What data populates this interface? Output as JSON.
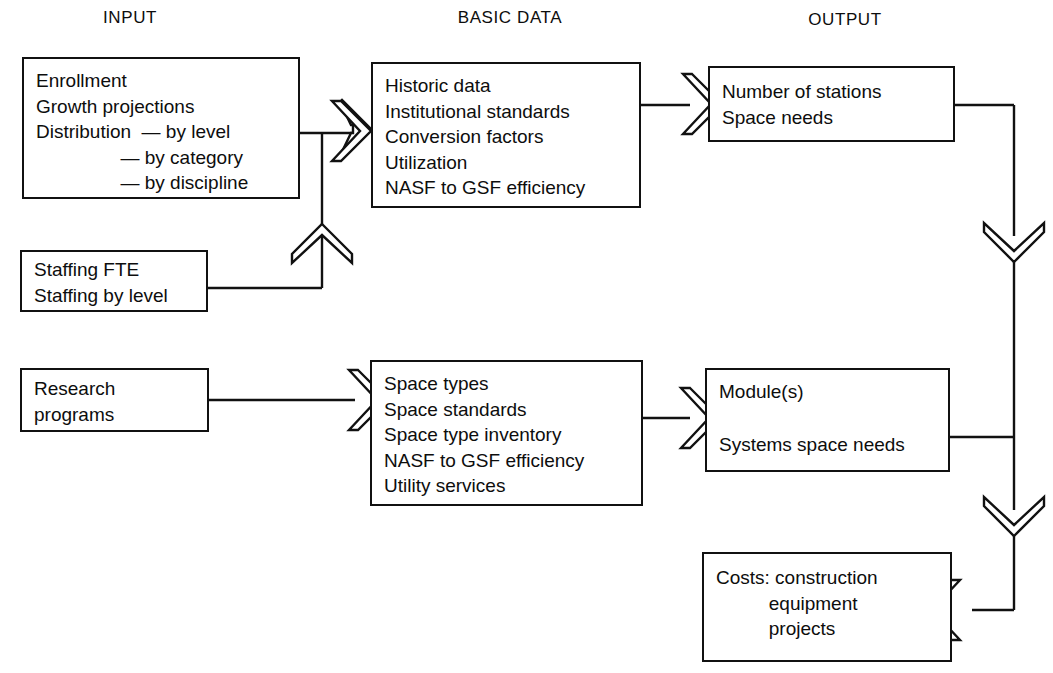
{
  "diagram": {
    "title_columns": [
      {
        "key": "input",
        "label": "INPUT"
      },
      {
        "key": "basic_data",
        "label": "BASIC DATA"
      },
      {
        "key": "output",
        "label": "OUTPUT"
      }
    ],
    "boxes": {
      "enrollment": {
        "name": "enrollment-box",
        "lines": [
          "Enrollment",
          "Growth projections",
          "Distribution  — by level",
          "                — by category",
          "                — by discipline"
        ]
      },
      "staffing": {
        "name": "staffing-box",
        "lines": [
          "Staffing FTE",
          "Staffing by level"
        ]
      },
      "research": {
        "name": "research-programs-box",
        "lines": [
          "Research",
          "programs"
        ]
      },
      "basic_data": {
        "name": "basic-data-box",
        "lines": [
          "Historic data",
          "Institutional standards",
          "Conversion factors",
          "Utilization",
          "NASF to GSF efficiency"
        ]
      },
      "space_types": {
        "name": "space-types-box",
        "lines": [
          "Space types",
          "Space standards",
          "Space type inventory",
          "NASF to GSF efficiency",
          "Utility services"
        ]
      },
      "stations": {
        "name": "number-of-stations-box",
        "lines": [
          "Number of stations",
          "Space needs"
        ]
      },
      "modules": {
        "name": "modules-box",
        "lines": [
          "Module(s)",
          "",
          "Systems space needs"
        ]
      },
      "costs": {
        "name": "costs-box",
        "lines": [
          "Costs: construction",
          "          equipment",
          "          projects"
        ]
      }
    },
    "connectors": [
      {
        "id": "enrollment-to-junction",
        "from": "enrollment",
        "to": "basic_data",
        "style": "line"
      },
      {
        "id": "staffing-to-junction",
        "from": "staffing",
        "to": "basic_data",
        "style": "line-with-up-chevron"
      },
      {
        "id": "junction-to-basic-data",
        "from": "junction",
        "to": "basic_data",
        "style": "right-chevron"
      },
      {
        "id": "basic-data-to-stations",
        "from": "basic_data",
        "to": "stations",
        "style": "right-chevron"
      },
      {
        "id": "research-to-space-types",
        "from": "research",
        "to": "space_types",
        "style": "right-chevron"
      },
      {
        "id": "space-types-to-modules",
        "from": "space_types",
        "to": "modules",
        "style": "right-chevron"
      },
      {
        "id": "stations-to-modules",
        "from": "stations",
        "to": "modules",
        "style": "down-chevron"
      },
      {
        "id": "modules-to-costs",
        "from": "modules",
        "to": "costs",
        "style": "down-chevron-then-left-chevron"
      }
    ],
    "colors": {
      "stroke": "#111111",
      "background": "#ffffff",
      "text": "#0d0d0d"
    }
  }
}
